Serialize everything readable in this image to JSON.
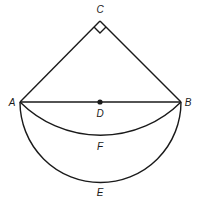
{
  "diagram": {
    "type": "geometry",
    "points": {
      "A": {
        "label": "A",
        "x": 20,
        "y": 102
      },
      "B": {
        "label": "B",
        "x": 181,
        "y": 102
      },
      "C": {
        "label": "C",
        "x": 100,
        "y": 21
      },
      "D": {
        "label": "D",
        "x": 100,
        "y": 102
      }
    },
    "arcs": {
      "F": {
        "label": "F",
        "center": "C",
        "from": "A",
        "to": "B"
      },
      "E": {
        "label": "E",
        "center": "D",
        "from": "A",
        "to": "B"
      }
    },
    "segments": [
      "AC",
      "BC",
      "AB"
    ],
    "right_angle_at": "C",
    "colors": {
      "stroke": "#1a1a1a",
      "background": "#ffffff"
    }
  }
}
